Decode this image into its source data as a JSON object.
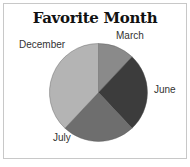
{
  "chart_data": {
    "type": "pie",
    "title": "Favorite Month",
    "categories": [
      "March",
      "June",
      "July",
      "December"
    ],
    "values": [
      12,
      26,
      24,
      38
    ],
    "colors": [
      "#8a8a8a",
      "#3c3c3c",
      "#6e6e6e",
      "#b4b4b4"
    ],
    "start_angle_deg": 0,
    "direction": "clockwise",
    "legend": "none (direct labels)"
  },
  "labels": {
    "march": "March",
    "june": "June",
    "july": "July",
    "december": "December"
  }
}
